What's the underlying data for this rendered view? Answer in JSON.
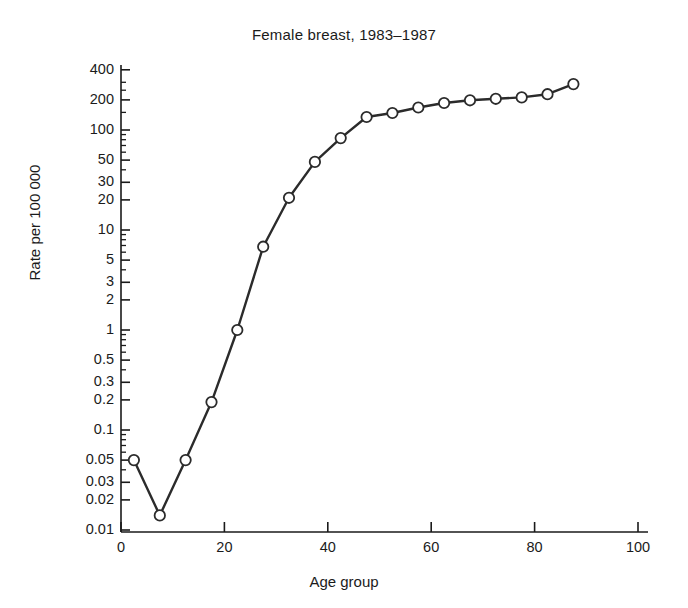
{
  "chart_data": {
    "type": "line",
    "title": "Female breast, 1983–1987",
    "xlabel": "Age group",
    "ylabel": "Rate per 100 000",
    "yscale": "log",
    "grid": false,
    "legend": null,
    "xlim": [
      0,
      100
    ],
    "ylim": [
      0.01,
      400
    ],
    "xticks": [
      0,
      20,
      40,
      60,
      80,
      100
    ],
    "xtick_labels": [
      "0",
      "20",
      "40",
      "60",
      "80",
      "100"
    ],
    "yticks": [
      400,
      200,
      100,
      50,
      30,
      20,
      10,
      5,
      3,
      2,
      1,
      0.5,
      0.3,
      0.2,
      0.1,
      0.05,
      0.03,
      0.02,
      0.01
    ],
    "ytick_labels": [
      "400",
      "200",
      "100",
      "50",
      "30",
      "20",
      "10",
      "5",
      "3",
      "2",
      "1",
      "0.5",
      "0.3",
      "0.2",
      "0.1",
      "0.05",
      "0.03",
      "0.02",
      "0.01"
    ],
    "marker": "open-circle",
    "line_color": "#2b2b2b",
    "marker_face_color": "#ffffff",
    "x": [
      2.5,
      7.5,
      12.5,
      17.5,
      22.5,
      27.5,
      32.5,
      37.5,
      42.5,
      47.5,
      52.5,
      57.5,
      62.5,
      67.5,
      72.5,
      77.5,
      82.5,
      87.5
    ],
    "values": [
      0.05,
      0.014,
      0.05,
      0.19,
      1.0,
      6.8,
      21,
      48,
      83,
      135,
      148,
      168,
      186,
      198,
      205,
      212,
      228,
      288
    ],
    "series": [
      {
        "name": "Female breast, 1983–1987",
        "x": [
          2.5,
          7.5,
          12.5,
          17.5,
          22.5,
          27.5,
          32.5,
          37.5,
          42.5,
          47.5,
          52.5,
          57.5,
          62.5,
          67.5,
          72.5,
          77.5,
          82.5,
          87.5
        ],
        "values": [
          0.05,
          0.014,
          0.05,
          0.19,
          1.0,
          6.8,
          21,
          48,
          83,
          135,
          148,
          168,
          186,
          198,
          205,
          212,
          228,
          288
        ]
      }
    ],
    "minor_ticks": [
      300,
      250,
      150,
      90,
      80,
      70,
      60,
      40,
      9,
      8,
      7,
      6,
      4,
      0.9,
      0.8,
      0.7,
      0.6,
      0.4,
      0.09,
      0.08,
      0.07,
      0.06,
      0.04
    ]
  }
}
